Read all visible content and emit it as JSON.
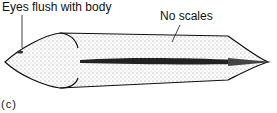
{
  "figure": {
    "panel_label": "(c)",
    "annotations": [
      {
        "id": "eyes",
        "text": "Eyes flush with body"
      },
      {
        "id": "scales",
        "text": "No scales"
      }
    ],
    "colors": {
      "ink": "#111111",
      "stipple": "#9a9a9a",
      "background": "#ffffff"
    }
  }
}
